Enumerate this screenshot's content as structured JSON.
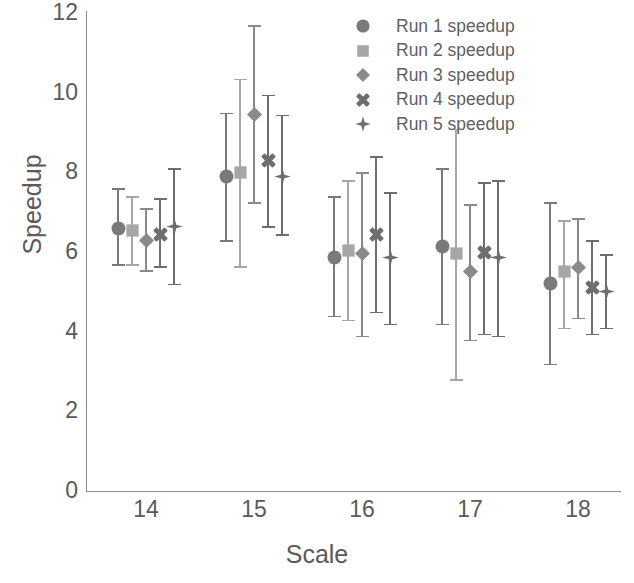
{
  "chart_data": {
    "type": "scatter",
    "title": "",
    "xlabel": "Scale",
    "ylabel": "Speedup",
    "categories": [
      14,
      15,
      16,
      17,
      18
    ],
    "xtick_labels": [
      "14",
      "15",
      "16",
      "17",
      "18"
    ],
    "ytick_labels": [
      "0",
      "2",
      "4",
      "6",
      "8",
      "10",
      "12"
    ],
    "yticks": [
      0,
      2,
      4,
      6,
      8,
      10,
      12
    ],
    "ylim": [
      0,
      12
    ],
    "grid": false,
    "legend_position": "top-right",
    "error_bars": "vertical, symmetric caps",
    "series": [
      {
        "name": "Run 1 speedup",
        "marker": "circle",
        "color": "#7a7a7a",
        "values": [
          6.6,
          7.9,
          5.85,
          6.15,
          5.2
        ],
        "err_low": [
          5.7,
          6.3,
          4.4,
          4.2,
          3.2
        ],
        "err_high": [
          7.6,
          9.5,
          7.4,
          8.1,
          7.25
        ]
      },
      {
        "name": "Run 2 speedup",
        "marker": "square",
        "color": "#a6a6a6",
        "values": [
          6.55,
          8.0,
          6.05,
          5.95,
          5.5
        ],
        "err_low": [
          5.7,
          5.65,
          4.3,
          2.8,
          4.1
        ],
        "err_high": [
          7.4,
          10.35,
          7.8,
          9.1,
          6.8
        ]
      },
      {
        "name": "Run 3 speedup",
        "marker": "diamond",
        "color": "#8a8a8a",
        "values": [
          6.3,
          9.45,
          5.95,
          5.5,
          5.6
        ],
        "err_low": [
          5.55,
          7.25,
          3.9,
          3.8,
          4.35
        ],
        "err_high": [
          7.1,
          11.7,
          8.0,
          7.2,
          6.85
        ]
      },
      {
        "name": "Run 4 speedup",
        "marker": "cross",
        "color": "#6e6e6e",
        "values": [
          6.45,
          8.3,
          6.45,
          6.0,
          5.1
        ],
        "err_low": [
          5.65,
          6.65,
          4.5,
          3.95,
          3.95
        ],
        "err_high": [
          7.35,
          9.95,
          8.4,
          7.75,
          6.3
        ]
      },
      {
        "name": "Run 5 speedup",
        "marker": "star",
        "color": "#6e6e6e",
        "values": [
          6.65,
          7.9,
          5.85,
          5.85,
          5.0
        ],
        "err_low": [
          5.2,
          6.45,
          4.2,
          3.9,
          4.1
        ],
        "err_high": [
          8.1,
          9.45,
          7.5,
          7.8,
          5.95
        ]
      }
    ]
  },
  "legend": {
    "items": [
      {
        "label": "Run 1 speedup",
        "marker": "circle",
        "color": "#7a7a7a"
      },
      {
        "label": "Run 2 speedup",
        "marker": "square",
        "color": "#a6a6a6"
      },
      {
        "label": "Run 3 speedup",
        "marker": "diamond",
        "color": "#8a8a8a"
      },
      {
        "label": "Run 4 speedup",
        "marker": "cross",
        "color": "#6e6e6e"
      },
      {
        "label": "Run 5 speedup",
        "marker": "star",
        "color": "#6e6e6e"
      }
    ]
  },
  "axes": {
    "y_title": "Speedup",
    "x_title": "Scale",
    "axis_color": "#8a8a8a",
    "tick_text_color": "#5a5a5a"
  }
}
